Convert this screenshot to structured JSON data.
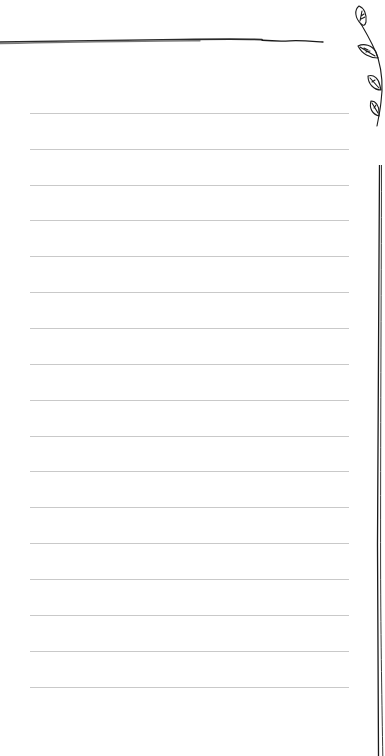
{
  "page": {
    "type": "lined-notepaper",
    "background": "#ffffff",
    "line_color": "#c9c9c9",
    "ink_color": "#1a1a1a",
    "line_count": 17,
    "first_line_y": 113,
    "line_spacing": 35.9,
    "line_left": 30,
    "line_right": 349
  },
  "decorations": {
    "top_stroke": "hand-drawn-horizontal-rule",
    "corner_ornament": "leaf-sprig-icon",
    "side_border": "hand-drawn-double-vertical-rule"
  }
}
